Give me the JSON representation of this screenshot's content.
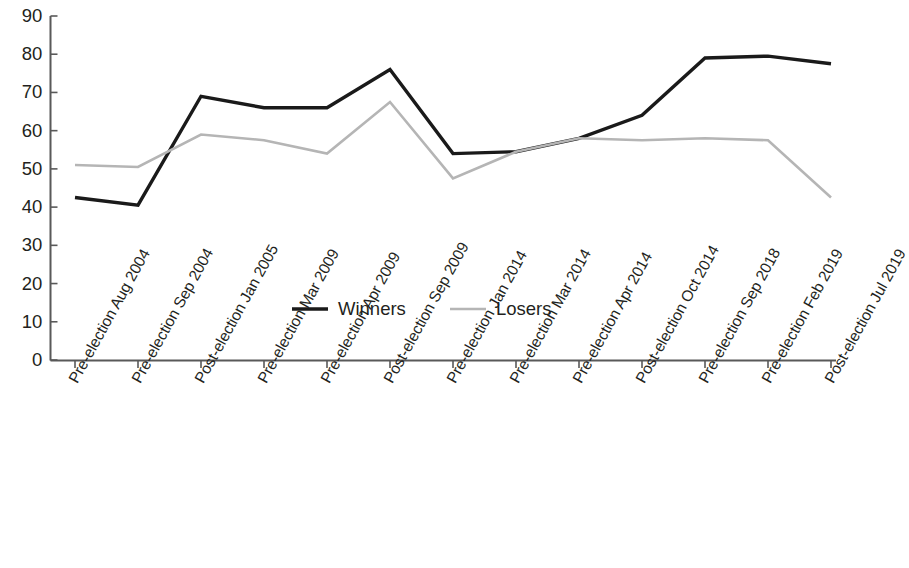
{
  "chart_data": {
    "type": "line",
    "title": "",
    "xlabel": "",
    "ylabel": "",
    "ylim": [
      0,
      90
    ],
    "ytick_values": [
      90,
      80,
      70,
      60,
      50,
      40,
      30,
      20,
      10,
      0
    ],
    "ytick_labels": [
      "90",
      "80",
      "70",
      "60",
      "50",
      "40",
      "30",
      "20",
      "10",
      "0"
    ],
    "grid": false,
    "legend_position": "center-inside",
    "categories": [
      "Pre-election Aug 2004",
      "Pre-election Sep 2004",
      "Post-election Jan 2005",
      "Pre-election Mar 2009",
      "Pre-election Apr 2009",
      "Post-election Sep 2009",
      "Pre-election Jan 2014",
      "Pre-election Mar 2014",
      "Pre-election Apr 2014",
      "Post-election Oct 2014",
      "Pre-election Sep 2018",
      "Pre-election Feb 2019",
      "Post-election Jul 2019"
    ],
    "series": [
      {
        "name": "Winners",
        "color": "#1a1a1a",
        "values": [
          42.5,
          40.5,
          69.0,
          66.0,
          66.0,
          76.0,
          54.0,
          54.5,
          58.0,
          64.0,
          79.0,
          79.5,
          77.5
        ]
      },
      {
        "name": "Losers",
        "color": "#b5b5b5",
        "values": [
          51.0,
          50.5,
          59.0,
          57.5,
          54.0,
          67.5,
          47.5,
          54.5,
          58.0,
          57.5,
          58.0,
          57.5,
          42.5
        ]
      }
    ]
  },
  "legend": {
    "items": [
      {
        "label": "Winners",
        "color": "#1a1a1a"
      },
      {
        "label": "Losers",
        "color": "#b5b5b5"
      }
    ]
  },
  "axes": {
    "y_axis_name": "value-axis",
    "x_axis_name": "category-axis"
  }
}
